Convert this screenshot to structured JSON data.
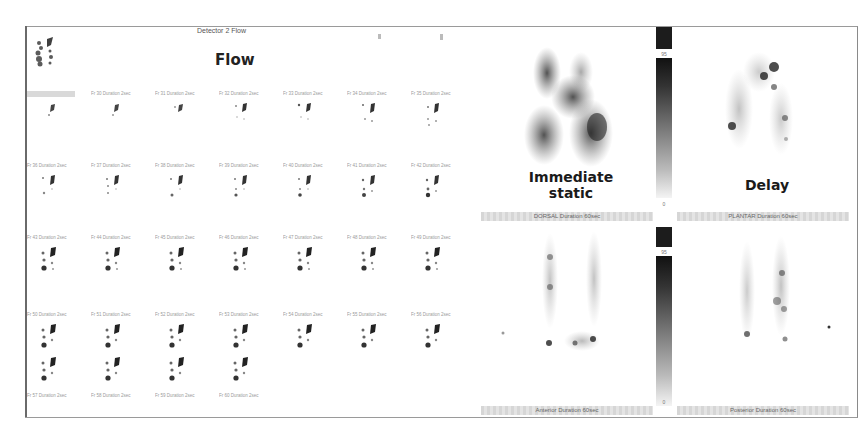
{
  "window": {
    "detector_title": "Detector 2 Flow",
    "flow_annotation": "Flow"
  },
  "flow_frames": {
    "columns": 7,
    "rows": [
      [
        "",
        "Fr 30 Duration 2sec",
        "Fr 31 Duration 2sec",
        "Fr 32 Duration 2sec",
        "Fr 33 Duration 2sec",
        "Fr 34 Duration 2sec",
        "Fr 35 Duration 2sec"
      ],
      [
        "Fr 36 Duration 2sec",
        "Fr 37 Duration 2sec",
        "Fr 38 Duration 2sec",
        "Fr 39 Duration 2sec",
        "Fr 40 Duration 2sec",
        "Fr 41 Duration 2sec",
        "Fr 42 Duration 2sec"
      ],
      [
        "Fr 43 Duration 2sec",
        "Fr 44 Duration 2sec",
        "Fr 45 Duration 2sec",
        "Fr 46 Duration 2sec",
        "Fr 47 Duration 2sec",
        "Fr 48 Duration 2sec",
        "Fr 49 Duration 2sec"
      ],
      [
        "Fr 50 Duration 2sec",
        "Fr 51 Duration 2sec",
        "Fr 52 Duration 2sec",
        "Fr 53 Duration 2sec",
        "Fr 54 Duration 2sec",
        "Fr 55 Duration 2sec",
        "Fr 56 Duration 2sec"
      ],
      [
        "Fr 57 Duration 2sec",
        "Fr 58 Duration 2sec",
        "Fr 59 Duration 2sec",
        "Fr 60 Duration 2sec"
      ]
    ]
  },
  "static_images": {
    "immediate_label_line1": "Immediate",
    "immediate_label_line2": "static",
    "delay_label": "Delay",
    "panels": [
      {
        "caption": "DORSAL Duration 60sec"
      },
      {
        "caption": "PLANTAR Duration 60sec"
      },
      {
        "caption": "Anterior Duration 60sec"
      },
      {
        "caption": "Posterior Duration 60sec"
      }
    ],
    "colorbar": {
      "top_max": "95",
      "top_min": "0",
      "bottom_max": "95",
      "bottom_min": "0"
    }
  }
}
